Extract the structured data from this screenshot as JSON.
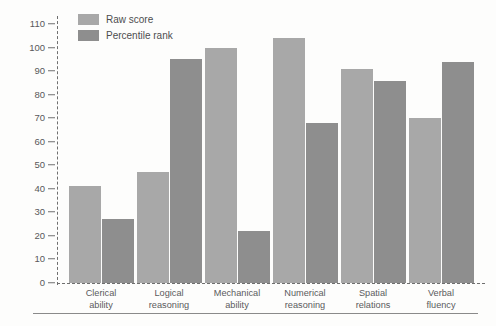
{
  "chart_data": {
    "type": "bar",
    "title": "",
    "xlabel": "",
    "ylabel": "",
    "ylim": [
      0,
      110
    ],
    "yticks": [
      0,
      10,
      20,
      30,
      40,
      50,
      60,
      70,
      80,
      90,
      100,
      110
    ],
    "grid": false,
    "legend_position": "top-left-inside",
    "categories": [
      "Clerical ability",
      "Logical reasoning",
      "Mechanical ability",
      "Numerical reasoning",
      "Spatial relations",
      "Verbal fluency"
    ],
    "category_lines": [
      [
        "Clerical",
        "ability"
      ],
      [
        "Logical",
        "reasoning"
      ],
      [
        "Mechanical",
        "ability"
      ],
      [
        "Numerical",
        "reasoning"
      ],
      [
        "Spatial",
        "relations"
      ],
      [
        "Verbal",
        "fluency"
      ]
    ],
    "series": [
      {
        "name": "Raw score",
        "color": "#a8a8a8",
        "values": [
          41,
          47,
          100,
          104,
          91,
          70
        ]
      },
      {
        "name": "Percentile rank",
        "color": "#8e8e8e",
        "values": [
          27,
          95,
          22,
          68,
          86,
          94
        ]
      }
    ]
  },
  "legend": {
    "items": [
      {
        "label": "Raw score",
        "swatch": "raw"
      },
      {
        "label": "Percentile rank",
        "swatch": "pct"
      }
    ]
  },
  "axis": {
    "y_tick_labels": [
      "110",
      "100",
      "90",
      "80",
      "70",
      "60",
      "50",
      "40",
      "30",
      "20",
      "10",
      "0"
    ]
  }
}
